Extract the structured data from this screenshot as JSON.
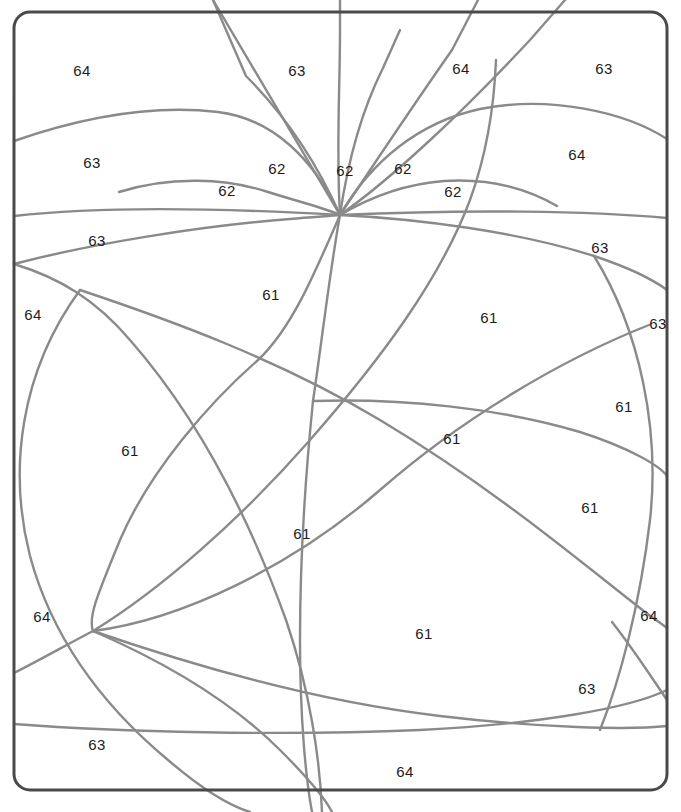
{
  "diagram": {
    "kind": "planar-subdivision",
    "background_color": "#ffffff",
    "frame": {
      "name": "rounded-rectangle-border",
      "color": "#4a4a4a",
      "stroke_width": 3,
      "corner_radius": 16,
      "x": 14,
      "y": 12,
      "width": 653,
      "height": 778
    },
    "curve_style": {
      "color": "#8a8a8a",
      "stroke_width": 2.4
    },
    "apex_point": {
      "x": 340,
      "y": 215
    },
    "junction_points": [
      {
        "x": 340,
        "y": 215
      },
      {
        "x": 313,
        "y": 401
      },
      {
        "x": 93,
        "y": 631
      },
      {
        "x": 612,
        "y": 622
      },
      {
        "x": 649,
        "y": 325
      },
      {
        "x": 80,
        "y": 290
      }
    ],
    "labels": [
      {
        "text": "64",
        "x": 82,
        "y": 70
      },
      {
        "text": "63",
        "x": 297,
        "y": 70
      },
      {
        "text": "64",
        "x": 461,
        "y": 68
      },
      {
        "text": "63",
        "x": 604,
        "y": 68
      },
      {
        "text": "63",
        "x": 92,
        "y": 162
      },
      {
        "text": "62",
        "x": 277,
        "y": 168
      },
      {
        "text": "62",
        "x": 345,
        "y": 170
      },
      {
        "text": "62",
        "x": 403,
        "y": 168
      },
      {
        "text": "64",
        "x": 577,
        "y": 154
      },
      {
        "text": "62",
        "x": 227,
        "y": 190
      },
      {
        "text": "62",
        "x": 453,
        "y": 191
      },
      {
        "text": "63",
        "x": 97,
        "y": 240
      },
      {
        "text": "63",
        "x": 600,
        "y": 247
      },
      {
        "text": "64",
        "x": 33,
        "y": 314
      },
      {
        "text": "63",
        "x": 658,
        "y": 323
      },
      {
        "text": "61",
        "x": 271,
        "y": 294
      },
      {
        "text": "61",
        "x": 489,
        "y": 317
      },
      {
        "text": "61",
        "x": 624,
        "y": 406
      },
      {
        "text": "61",
        "x": 452,
        "y": 438
      },
      {
        "text": "61",
        "x": 130,
        "y": 450
      },
      {
        "text": "61",
        "x": 590,
        "y": 507
      },
      {
        "text": "61",
        "x": 302,
        "y": 533
      },
      {
        "text": "64",
        "x": 42,
        "y": 616
      },
      {
        "text": "64",
        "x": 649,
        "y": 615
      },
      {
        "text": "61",
        "x": 424,
        "y": 633
      },
      {
        "text": "63",
        "x": 587,
        "y": 688
      },
      {
        "text": "63",
        "x": 97,
        "y": 744
      },
      {
        "text": "64",
        "x": 405,
        "y": 771
      }
    ],
    "curves": [
      {
        "name": "apex-ray-upper-left-steep",
        "d": "M 340 215 L 213 0"
      },
      {
        "name": "apex-ray-left-long",
        "d": "M 340 215 C 320 170 290 120 246 76 L 213 0"
      },
      {
        "name": "apex-ray-center-left",
        "d": "M 340 215 C 336 150 340 90 340 30 L 340 0"
      },
      {
        "name": "apex-ray-center-right",
        "d": "M 340 215 C 348 160 362 110 383 68 L 400 30"
      },
      {
        "name": "apex-ray-right-steep",
        "d": "M 340 215 C 370 170 410 110 452 50 L 478 0"
      },
      {
        "name": "apex-ray-far-right",
        "d": "M 340 215 C 390 180 460 115 530 40 L 565 0"
      },
      {
        "name": "arc-left-outer-63",
        "d": "M 14 141 C 80 118 150 104 218 112 C 274 119 314 160 340 215"
      },
      {
        "name": "arc-left-mid-62",
        "d": "M 119 192 C 170 176 226 178 268 192 C 303 203 325 208 340 215"
      },
      {
        "name": "arc-right-outer-64",
        "d": "M 340 215 C 372 160 420 122 480 109 C 550 95 625 112 667 139"
      },
      {
        "name": "arc-right-mid-62",
        "d": "M 340 215 C 372 196 405 184 444 181 C 492 178 528 189 557 206"
      },
      {
        "name": "band-top-flat-left",
        "d": "M 14 216 C 100 206 220 208 340 215"
      },
      {
        "name": "band-top-flat-right",
        "d": "M 340 215 C 470 209 590 211 667 218"
      },
      {
        "name": "big-arc-left-63",
        "d": "M 14 264 C 90 244 200 226 290 219 C 312 217 330 216 340 215"
      },
      {
        "name": "big-arc-right-63",
        "d": "M 340 215 C 420 219 520 232 594 256 C 630 268 655 281 667 290"
      },
      {
        "name": "left-circle-big",
        "d": "M 80 290 C 20 372 8 470 30 556 C 50 630 96 700 168 760 C 196 784 224 804 250 812"
      },
      {
        "name": "curve-left-descend-outer",
        "d": "M 14 264 C 60 278 96 300 130 340 C 200 420 250 520 286 620 C 310 690 320 760 322 812"
      },
      {
        "name": "curve-from-apex-down-left",
        "d": "M 340 215 C 312 280 290 330 258 360 C 210 402 150 470 120 540 C 96 598 88 618 93 631"
      },
      {
        "name": "curve-apex-to-center-junction",
        "d": "M 340 215 C 330 270 322 340 313 401"
      },
      {
        "name": "curve-center-junction-down",
        "d": "M 313 401 C 306 470 300 560 300 640 C 300 720 306 780 312 812"
      },
      {
        "name": "curve-diag-ne-to-sw",
        "d": "M 649 325 C 560 360 460 420 380 490 C 290 568 180 620 93 631"
      },
      {
        "name": "curve-diag-nw-to-se",
        "d": "M 80 290 C 170 320 280 360 380 420 C 500 492 590 570 649 615"
      },
      {
        "name": "curve-right-circle-big",
        "d": "M 594 256 C 640 330 660 430 650 520 C 640 604 620 680 600 730"
      },
      {
        "name": "curve-sweep-mid-right",
        "d": "M 313 401 C 400 398 500 408 580 432 C 630 448 660 466 667 476"
      },
      {
        "name": "curve-bottom-sweep-long",
        "d": "M 93 631 C 200 668 320 702 440 716 C 540 728 630 730 667 726"
      },
      {
        "name": "curve-bottom-flat",
        "d": "M 14 724 C 120 732 280 736 420 730 C 540 724 630 708 667 690"
      },
      {
        "name": "curve-lower-left-fan-a",
        "d": "M 93 631 C 160 660 230 700 280 750 C 310 780 326 800 332 812"
      },
      {
        "name": "curve-up-right-from-junction",
        "d": "M 93 631 C 160 590 240 520 310 440 C 380 360 440 280 470 200 C 486 156 494 110 496 60"
      },
      {
        "name": "curve-left-edge-to-junction",
        "d": "M 14 673 C 40 660 68 644 93 631"
      },
      {
        "name": "curve-right-edge-to-junction",
        "d": "M 649 615 C 656 620 662 624 667 628"
      },
      {
        "name": "curve-right-junction-to-corner",
        "d": "M 612 622 C 634 650 652 678 667 700"
      }
    ]
  }
}
